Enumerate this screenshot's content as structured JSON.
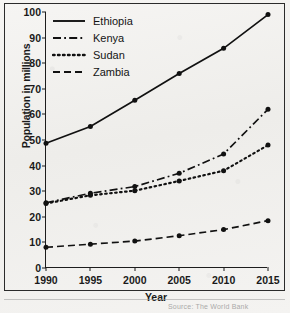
{
  "chart_data": {
    "type": "line",
    "title": "",
    "xlabel": "Year",
    "ylabel": "Population in millions",
    "x": [
      1990,
      1995,
      2000,
      2005,
      2010,
      2015
    ],
    "xtick_labels": [
      "1990",
      "1995",
      "2000",
      "2005",
      "2010",
      "2015"
    ],
    "ytick_labels": [
      "0",
      "10",
      "20",
      "30",
      "40",
      "50",
      "60",
      "70",
      "80",
      "90",
      "100"
    ],
    "yticks": [
      0,
      10,
      20,
      30,
      40,
      50,
      60,
      70,
      80,
      90,
      100
    ],
    "xlim": [
      1990,
      2015
    ],
    "ylim": [
      0,
      100
    ],
    "grid": false,
    "legend_position": "top-left",
    "series": [
      {
        "name": "Ethiopia",
        "dash": "solid",
        "color": "#111111",
        "values": [
          48.7,
          55.3,
          65.5,
          76.0,
          85.8,
          99.0
        ]
      },
      {
        "name": "Kenya",
        "dash": "dash-dot",
        "color": "#111111",
        "values": [
          25.5,
          29.2,
          31.8,
          37.0,
          44.5,
          62.0
        ]
      },
      {
        "name": "Sudan",
        "dash": "dotted",
        "color": "#111111",
        "values": [
          25.2,
          28.4,
          30.2,
          34.0,
          38.0,
          48.0
        ]
      },
      {
        "name": "Zambia",
        "dash": "dashed",
        "color": "#111111",
        "values": [
          8.1,
          9.3,
          10.5,
          12.6,
          15.0,
          18.5
        ]
      }
    ]
  },
  "legend": {
    "items": [
      {
        "label": "Ethiopia",
        "dash": "solid"
      },
      {
        "label": "Kenya",
        "dash": "dash-dot"
      },
      {
        "label": "Sudan",
        "dash": "dotted"
      },
      {
        "label": "Zambia",
        "dash": "dashed"
      }
    ]
  },
  "axes": {
    "y_title": "Population in millions",
    "x_title": "Year"
  },
  "source_note": "Source: The World Bank"
}
